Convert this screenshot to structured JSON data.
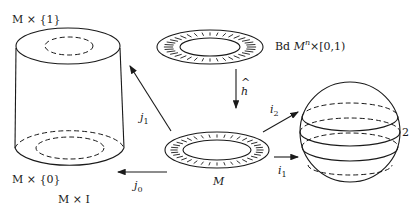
{
  "diagram": {
    "labels": {
      "cylinder_top": "M × {1}",
      "cylinder_bottom": "M × {0}",
      "cylinder_name": "M × I",
      "collar_name": "Bd Mⁿ × [0,1)",
      "collar_name_prefix": "Bd ",
      "collar_name_M": "M",
      "collar_name_sup": "n",
      "collar_name_suffix": "×[0,1)",
      "manifold": "M",
      "sphere_label": "2"
    },
    "arrows": {
      "h_hat": {
        "symbol": "h",
        "accent": "^"
      },
      "j1": {
        "base": "j",
        "sub": "1"
      },
      "j0": {
        "base": "j",
        "sub": "0"
      },
      "i1": {
        "base": "i",
        "sub": "1"
      },
      "i2": {
        "base": "i",
        "sub": "2"
      }
    },
    "colors": {
      "ink": "#1a1a1a",
      "background": "#ffffff"
    }
  }
}
